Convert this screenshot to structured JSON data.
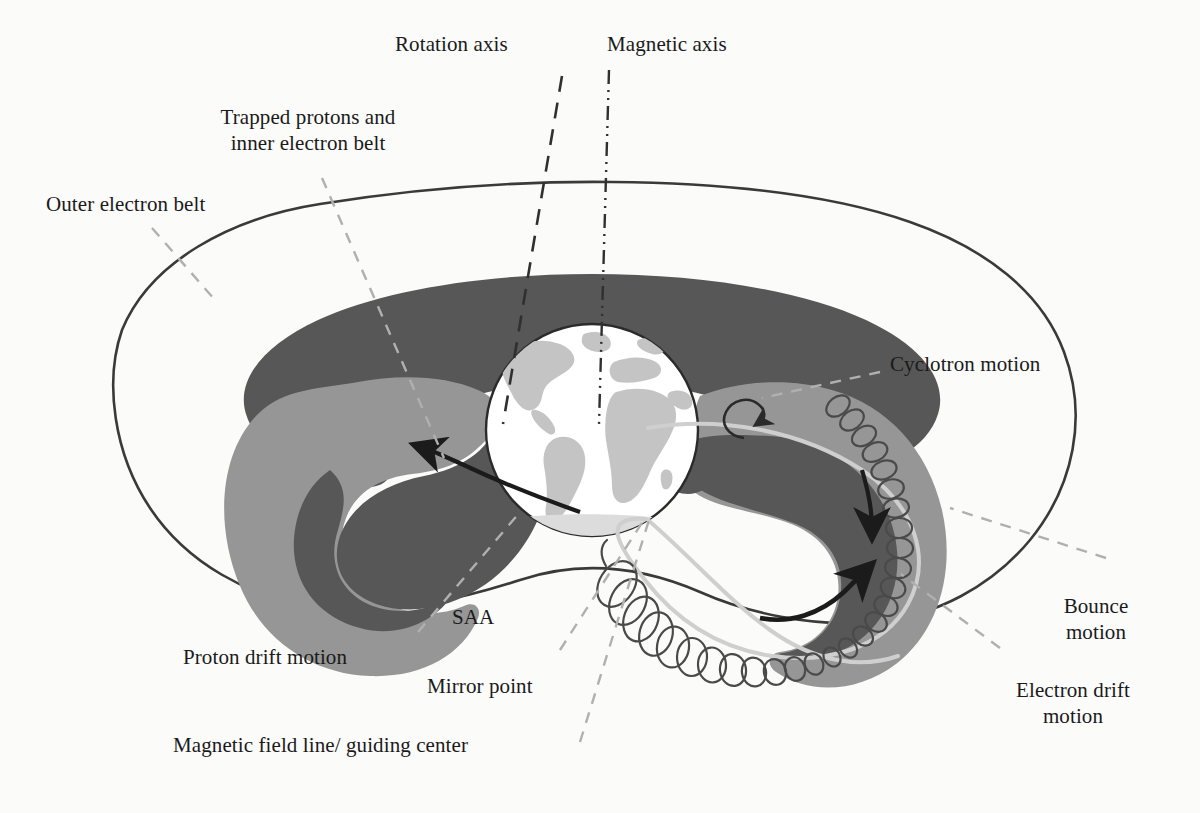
{
  "figure": {
    "background_color": "#fbfbfa",
    "ink_color": "#1a1a1a",
    "colors": {
      "outer_boundary_line": "#3a3a3a",
      "inner_belt_dark_gray": "#575757",
      "outer_belt_mid_gray": "#969696",
      "earth_ocean": "#ffffff",
      "earth_land": "#c4c4c4",
      "leader_line_gray": "#b0b0b0",
      "axis_line_dark": "#303030",
      "guiding_center_line": "#cfcfcf",
      "helix_line": "#4a4a4a",
      "arrow_color": "#1b1b1b"
    }
  },
  "labels": {
    "rotation_axis": "Rotation axis",
    "magnetic_axis": "Magnetic axis",
    "trapped_protons_line1": "Trapped protons and",
    "trapped_protons_line2": "inner electron belt",
    "outer_electron_belt": "Outer electron belt",
    "cyclotron_motion": "Cyclotron motion",
    "bounce_motion_line1": "Bounce",
    "bounce_motion_line2": "motion",
    "electron_drift_line1": "Electron drift",
    "electron_drift_line2": "motion",
    "proton_drift_motion": "Proton drift motion",
    "saa": "SAA",
    "mirror_point": "Mirror point",
    "magnetic_field_line": "Magnetic field line/ guiding center"
  },
  "annotations": {
    "axes": [
      {
        "name": "rotation-axis",
        "style": "dashed",
        "from": [
          560,
          78
        ],
        "to": [
          505,
          420
        ]
      },
      {
        "name": "magnetic-axis",
        "style": "dash-dot-dot",
        "from": [
          608,
          72
        ],
        "to": [
          600,
          420
        ]
      }
    ],
    "leaders": [
      {
        "name": "trapped-protons-leader",
        "from": [
          322,
          178
        ],
        "to": [
          444,
          458
        ]
      },
      {
        "name": "outer-electron-belt-leader",
        "from": [
          152,
          228
        ],
        "to": [
          215,
          300
        ]
      },
      {
        "name": "cyclotron-leader",
        "from": [
          880,
          372
        ],
        "to": [
          760,
          398
        ]
      },
      {
        "name": "bounce-leader",
        "from": [
          1105,
          558
        ],
        "to": [
          950,
          508
        ]
      },
      {
        "name": "electron-drift-leader",
        "from": [
          1000,
          648
        ],
        "to": [
          903,
          575
        ]
      },
      {
        "name": "saa-leader",
        "from": [
          418,
          632
        ],
        "to": [
          518,
          512
        ]
      },
      {
        "name": "mirror-point-leader",
        "from": [
          560,
          650
        ],
        "to": [
          645,
          518
        ]
      },
      {
        "name": "field-line-leader",
        "from": [
          580,
          742
        ],
        "to": [
          648,
          520
        ]
      }
    ],
    "motion_arrows": [
      {
        "name": "proton-drift-arrow",
        "direction": "counterclockwise-left-belt"
      },
      {
        "name": "electron-drift-arrow-down",
        "direction": "downward-right-belt"
      },
      {
        "name": "electron-drift-arrow-up",
        "direction": "upward-right-belt"
      },
      {
        "name": "cyclotron-loop-arrow",
        "direction": "small-circular-loop"
      }
    ],
    "helix": {
      "name": "field-line-helix",
      "description": "Spiralling particle trajectory around the guiding-centre magnetic field line, from the outer belt down to the mirror point"
    }
  }
}
